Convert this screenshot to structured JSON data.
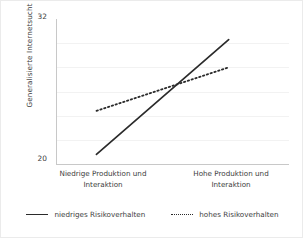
{
  "chart_data": {
    "type": "line",
    "title": "",
    "xlabel": "",
    "ylabel": "Generalisierte Internetsucht",
    "categories": [
      "Niedrige Produktion und Interaktion",
      "Hohe Produktion und Interaktion"
    ],
    "category_lines": [
      [
        "Niedrige Produktion und",
        "Interaktion"
      ],
      [
        "Hohe Produktion und",
        "Interaktion"
      ]
    ],
    "ylim": [
      20,
      32
    ],
    "ytick_labels": [
      "32",
      "20"
    ],
    "ytick_values": [
      32,
      20
    ],
    "grid": "horizontal",
    "gridline_values": [
      30,
      28,
      26,
      24,
      22
    ],
    "legend_position": "bottom",
    "series": [
      {
        "name": "niedriges Risikoverhalten",
        "style": "solid",
        "color": "#2b2b2b",
        "values": [
          20.8,
          30.3
        ]
      },
      {
        "name": "hohes Risikoverhalten",
        "style": "dotted",
        "color": "#2b2b2b",
        "values": [
          24.4,
          28.0
        ]
      }
    ]
  },
  "axes": {
    "y_title": "Generalisierte Internetsucht",
    "y_max_label": "32",
    "y_min_label": "20"
  },
  "x_categories": {
    "left_line1": "Niedrige Produktion und",
    "left_line2": "Interaktion",
    "right_line1": "Hohe Produktion und",
    "right_line2": "Interaktion"
  },
  "legend": {
    "entry_solid": "niedriges Risikoverhalten",
    "entry_dotted": "hohes Risikoverhalten"
  },
  "colors": {
    "line": "#2b2b2b",
    "grid": "#f2f2f2",
    "axis": "#c8c8c8",
    "text": "#3d3d3d",
    "background": "#ffffff"
  }
}
